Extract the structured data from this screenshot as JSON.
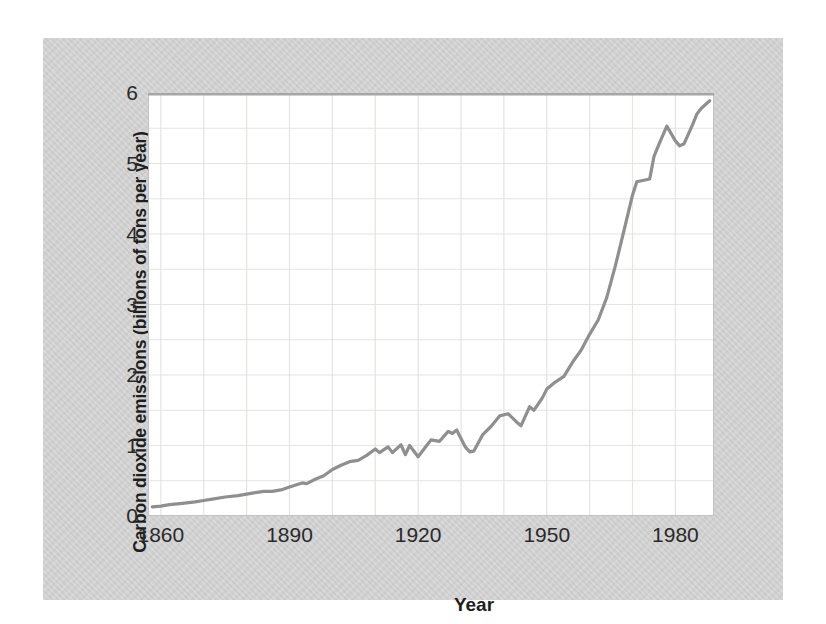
{
  "figure": {
    "page_background": "#ffffff",
    "card_background": "#d4d4d4"
  },
  "chart_data": {
    "type": "line",
    "title": "",
    "xlabel": "Year",
    "ylabel": "Carbon dioxide emissions (billions of tons per year)",
    "xlim": [
      1857,
      1989
    ],
    "ylim": [
      0,
      6
    ],
    "x_ticks": [
      "1860",
      "1890",
      "1920",
      "1950",
      "1980"
    ],
    "x_tick_years": [
      1860,
      1890,
      1920,
      1950,
      1980
    ],
    "y_ticks": [
      "0",
      "1",
      "2",
      "3",
      "4",
      "5",
      "6"
    ],
    "y_tick_values": [
      0,
      1,
      2,
      3,
      4,
      5,
      6
    ],
    "grid": "on",
    "x_grid_start_year": 1860,
    "x_grid_interval_years": 10,
    "y_grid_interval": 0.5,
    "legend": "none",
    "line_color": "#8f8f8f",
    "line_width": 3.2,
    "grid_color": "#e2e5e0",
    "plot_border_color": "#c2c2c2",
    "plot_top_border_color": "#a6a6a6",
    "text_color": "#2a2a2a",
    "series": [
      {
        "name": "Carbon dioxide emissions",
        "points": [
          [
            1858,
            0.13
          ],
          [
            1860,
            0.14
          ],
          [
            1862,
            0.16
          ],
          [
            1865,
            0.18
          ],
          [
            1868,
            0.2
          ],
          [
            1870,
            0.22
          ],
          [
            1872,
            0.24
          ],
          [
            1875,
            0.27
          ],
          [
            1878,
            0.29
          ],
          [
            1880,
            0.31
          ],
          [
            1882,
            0.33
          ],
          [
            1884,
            0.35
          ],
          [
            1886,
            0.35
          ],
          [
            1888,
            0.37
          ],
          [
            1890,
            0.41
          ],
          [
            1892,
            0.45
          ],
          [
            1893,
            0.47
          ],
          [
            1894,
            0.46
          ],
          [
            1896,
            0.52
          ],
          [
            1898,
            0.57
          ],
          [
            1900,
            0.66
          ],
          [
            1902,
            0.72
          ],
          [
            1904,
            0.77
          ],
          [
            1906,
            0.79
          ],
          [
            1908,
            0.86
          ],
          [
            1910,
            0.95
          ],
          [
            1911,
            0.9
          ],
          [
            1913,
            0.98
          ],
          [
            1914,
            0.9
          ],
          [
            1916,
            1.01
          ],
          [
            1917,
            0.87
          ],
          [
            1918,
            1.0
          ],
          [
            1920,
            0.84
          ],
          [
            1922,
            1.0
          ],
          [
            1923,
            1.08
          ],
          [
            1925,
            1.06
          ],
          [
            1927,
            1.2
          ],
          [
            1928,
            1.17
          ],
          [
            1929,
            1.22
          ],
          [
            1931,
            0.98
          ],
          [
            1932,
            0.91
          ],
          [
            1933,
            0.92
          ],
          [
            1935,
            1.15
          ],
          [
            1937,
            1.27
          ],
          [
            1939,
            1.42
          ],
          [
            1941,
            1.45
          ],
          [
            1943,
            1.33
          ],
          [
            1944,
            1.28
          ],
          [
            1946,
            1.55
          ],
          [
            1947,
            1.5
          ],
          [
            1949,
            1.68
          ],
          [
            1950,
            1.8
          ],
          [
            1952,
            1.9
          ],
          [
            1954,
            1.98
          ],
          [
            1956,
            2.18
          ],
          [
            1958,
            2.35
          ],
          [
            1960,
            2.58
          ],
          [
            1962,
            2.78
          ],
          [
            1964,
            3.1
          ],
          [
            1966,
            3.55
          ],
          [
            1968,
            4.05
          ],
          [
            1970,
            4.55
          ],
          [
            1971,
            4.74
          ],
          [
            1974,
            4.78
          ],
          [
            1975,
            5.1
          ],
          [
            1976,
            5.25
          ],
          [
            1978,
            5.53
          ],
          [
            1980,
            5.32
          ],
          [
            1981,
            5.25
          ],
          [
            1982,
            5.28
          ],
          [
            1984,
            5.55
          ],
          [
            1985,
            5.7
          ],
          [
            1986,
            5.78
          ],
          [
            1988,
            5.89
          ]
        ]
      }
    ]
  }
}
